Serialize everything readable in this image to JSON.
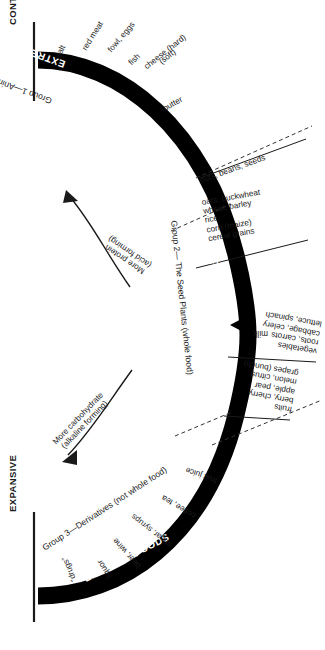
{
  "diagram": {
    "axis": {
      "top_label": "CONTRACTIVE",
      "bottom_label": "EXPANSIVE"
    },
    "band": {
      "color": "#000000",
      "segments": [
        {
          "band_title": "EXTREME FOODS",
          "group_label": "Group 1—Animal Products"
        },
        {
          "band_title": "CENTERED FOODS",
          "group_label": "Group 2— The Seed Plants (whole food)"
        },
        {
          "band_title": "EXTREME FOODS",
          "group_label": "Group 3—Derivatives (not whole food)"
        }
      ]
    },
    "arrows": [
      {
        "name": "more-protein",
        "line1": "More protein",
        "line2": "(acid forming)",
        "direction": "up-left"
      },
      {
        "name": "more-carbohydrate",
        "line1": "More carbohydrate",
        "line2": "(alkaline forming)",
        "direction": "down-left"
      }
    ],
    "pointer": {
      "label": "milk",
      "shape": "triangle"
    },
    "foods": {
      "animal_products": [
        "salt",
        "red meat",
        "fowl, eggs",
        "fish",
        "cheese (hard)",
        "(soft)",
        "butter"
      ],
      "nuts_group": [
        "nuts, beans, seeds"
      ],
      "grains_group": [
        "oats, buckwheat",
        "wheat, barley",
        "rice",
        "corn (maize)",
        "cereal grains"
      ],
      "vegetables_group": [
        "vegetables",
        "roots, carrots",
        "cabbage, celery",
        "lettuce, spinach"
      ],
      "fruits_group": [
        "fruits",
        "berry, cherry",
        "apple, pear",
        "melon, citrus",
        "grapes (bunch)"
      ],
      "derivatives": [
        "fruit juice",
        "coffee, tea",
        "sugar, syrups",
        "beer, wine",
        "liquor",
        "“drugs”"
      ]
    }
  }
}
